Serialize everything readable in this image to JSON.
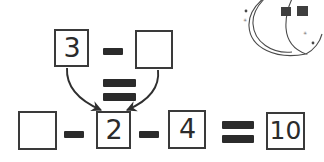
{
  "page": {
    "background_color": "#ffffff",
    "ink_color": "#2b2b2b",
    "stroke_color": "#3a3a3a",
    "width": 324,
    "height": 162
  },
  "decoration": {
    "name": "crescent-moon-with-stars",
    "moon_label": "crescent moon",
    "sparkles": [
      "star-small-left",
      "sparkle-left",
      "star-dot-right",
      "sparkle-right"
    ],
    "flags": [
      "flag-left",
      "flag-right"
    ],
    "color": "#4a4a4a"
  },
  "top_equation": {
    "label": "3 - ? =",
    "terms": [
      {
        "kind": "box",
        "value": "3",
        "filled": true,
        "name": "box-three"
      },
      {
        "kind": "operator",
        "value": "−",
        "name": "minus-operator"
      },
      {
        "kind": "box",
        "value": "",
        "filled": false,
        "name": "box-blank-top"
      }
    ],
    "result_operator": "="
  },
  "bottom_equation": {
    "label": "? - 2 - 4 = 10",
    "terms": [
      {
        "kind": "box",
        "value": "",
        "filled": false,
        "name": "box-blank-bottom"
      },
      {
        "kind": "operator",
        "value": "−",
        "name": "minus-operator-1"
      },
      {
        "kind": "box",
        "value": "2",
        "filled": true,
        "name": "box-two"
      },
      {
        "kind": "operator",
        "value": "−",
        "name": "minus-operator-2"
      },
      {
        "kind": "box",
        "value": "4",
        "filled": true,
        "name": "box-four"
      },
      {
        "kind": "operator",
        "value": "=",
        "name": "equals-operator"
      },
      {
        "kind": "box",
        "value": "10",
        "filled": true,
        "name": "box-ten"
      }
    ]
  },
  "connectors": {
    "left_arrow": {
      "name": "arrow-three-to-two",
      "from": "box-three",
      "to": "box-two"
    },
    "right_arrow": {
      "name": "arrow-blank-to-two",
      "from": "box-blank-top",
      "to": "box-two"
    }
  }
}
